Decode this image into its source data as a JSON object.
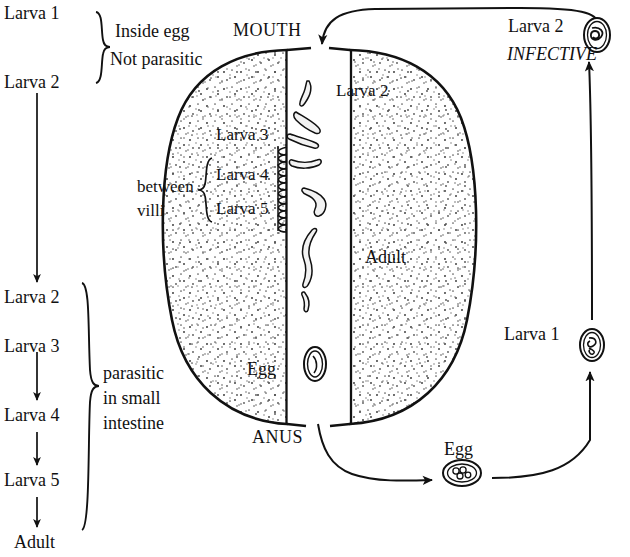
{
  "figure": {
    "kind": "life-cycle-diagram",
    "ink_color": "#111111",
    "background_color": "#ffffff",
    "stipple_color": "#555555"
  },
  "left_column": {
    "stage_top_1": "Larva 1",
    "stage_top_2": "Larva 2",
    "bracket_top_line1": "Inside egg",
    "bracket_top_line2": "Not parasitic",
    "stage_bottom_1": "Larva 2",
    "stage_bottom_2": "Larva 3",
    "stage_bottom_3": "Larva 4",
    "stage_bottom_4": "Larva 5",
    "stage_bottom_5": "Adult",
    "bracket_bottom_line1": "parasitic",
    "bracket_bottom_line2": "in small",
    "bracket_bottom_line3": "intestine"
  },
  "host_body": {
    "mouth_label": "MOUTH",
    "anus_label": "ANUS",
    "lumen_larva_label": "Larva 2",
    "villi_stage_1": "Larva 3",
    "villi_stage_2": "Larva 4",
    "villi_stage_3": "Larva 5",
    "villi_bracket_line1": "between",
    "villi_bracket_line2": "villi",
    "adult_label": "Adult",
    "egg_label": "Egg"
  },
  "right_column": {
    "infective_stage": "Larva 2",
    "infective_note": "INFECTIVE",
    "larva1_label": "Larva 1",
    "external_egg_label": "Egg"
  }
}
